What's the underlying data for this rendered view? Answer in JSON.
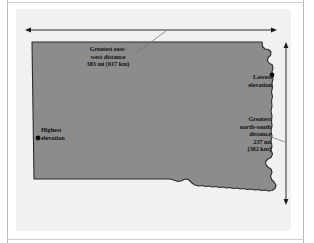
{
  "figure": {
    "colors": {
      "state_fill": "#8c8c8c",
      "state_outline": "#2b2b2b",
      "panel_background": "#f1f1f1",
      "page_background": "#ffffff",
      "frame_rule": "#b9b9b9",
      "text": "#111111",
      "arrow": "#1a1a1a",
      "leader_line": "#6f6f6f",
      "marker_dot": "#0c0c0c"
    }
  },
  "annotations": {
    "east_west": {
      "name": "greatest-east-west-distance",
      "line1": "Greatest east-",
      "line2": "west distance",
      "line3": "383 mi (617 km)",
      "text": "Greatest east-\nwest distance\n383 mi (617 km)",
      "miles": 383,
      "kilometers": 617
    },
    "north_south": {
      "name": "greatest-north-south-distance",
      "line1": "Greatest",
      "line2": "north-south",
      "line3": "distance",
      "line4": "237 mi",
      "line5": "(382 km)",
      "text": "Greatest\nnorth-south\ndistance\n237 mi\n(382 km)",
      "miles": 237,
      "kilometers": 382
    },
    "lowest_elevation": {
      "name": "lowest-elevation",
      "line1": "Lowest",
      "line2": "elevation",
      "text": "Lowest\nelevation"
    },
    "highest_elevation": {
      "name": "highest-elevation",
      "line1": "Highest",
      "line2": "elevation",
      "text": "Highest\nelevation"
    }
  },
  "markers": [
    {
      "name": "lowest-elevation-dot",
      "x": 272,
      "y": 75
    },
    {
      "name": "highest-elevation-dot",
      "x": 38,
      "y": 138
    }
  ],
  "measure_arrows": {
    "horizontal": {
      "name": "east-west-measure-arrow",
      "orientation": "horizontal",
      "double_headed": true,
      "x1": 25,
      "x2": 277,
      "y": 30
    },
    "vertical": {
      "name": "north-south-measure-arrow",
      "orientation": "vertical",
      "double_headed": true,
      "y1": 42,
      "y2": 205,
      "x": 286
    }
  },
  "leader_lines": [
    {
      "name": "east-west-leader-line",
      "x1": 136,
      "y1": 52,
      "x2": 164,
      "y2": 31
    },
    {
      "name": "north-south-leader-line",
      "x1": 264,
      "y1": 135,
      "x2": 285,
      "y2": 142
    }
  ]
}
